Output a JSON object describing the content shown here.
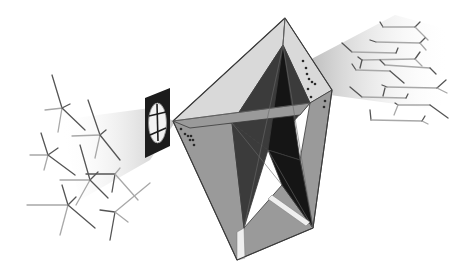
{
  "canvas": {
    "width": 470,
    "height": 271,
    "background": "#ffffff"
  },
  "colors": {
    "edge": "#3a3a3a",
    "face_light": "#d9d9d9",
    "face_mid": "#9a9a9a",
    "face_dark": "#3b3b3b",
    "face_black": "#151515",
    "molecule_dark": "#555555",
    "molecule_light": "#a8a8a8",
    "beam": "#bdbdbd",
    "filter_frame": "#1c1c1c",
    "filter_glass": "#f2f2f2",
    "dots": "#2a2a2a"
  },
  "crystal": {
    "vertices": {
      "apex": [
        285,
        18
      ],
      "left": [
        173,
        121
      ],
      "right": [
        332,
        90
      ],
      "bottom": [
        237,
        260
      ],
      "bottom_right": [
        313,
        228
      ],
      "inner_left": [
        232,
        123
      ],
      "inner_right": [
        310,
        103
      ],
      "inner_top": [
        283,
        45
      ],
      "inner_bottom": [
        244,
        228
      ],
      "star_mid": [
        268,
        150
      ],
      "star_lower": [
        282,
        185
      ]
    },
    "faces": [
      {
        "name": "top-left-face",
        "points": "285,18 173,121 232,123 283,45",
        "fill": "face_light"
      },
      {
        "name": "top-right-face",
        "points": "285,18 332,90 310,103 283,45",
        "fill": "face_light"
      },
      {
        "name": "left-face",
        "points": "173,121 232,123 244,228 237,260",
        "fill": "face_mid"
      },
      {
        "name": "right-face",
        "points": "332,90 313,228 300,160 310,103",
        "fill": "face_mid"
      },
      {
        "name": "bottom-face",
        "points": "237,260 313,228 282,185 244,228",
        "fill": "face_mid"
      },
      {
        "name": "inner-dark-upper",
        "points": "283,45 232,123 268,150 310,103",
        "fill": "face_dark"
      },
      {
        "name": "inner-black-core",
        "points": "283,45 268,150 300,160",
        "fill": "face_black"
      },
      {
        "name": "inner-dark-lower",
        "points": "232,123 244,228 268,150",
        "fill": "face_dark"
      },
      {
        "name": "inner-black-lower",
        "points": "268,150 300,160 313,228 282,185",
        "fill": "face_black"
      },
      {
        "name": "star-band",
        "points": "173,121 310,103 300,115 190,128",
        "fill": "face_mid"
      }
    ],
    "highlights": [
      {
        "name": "lower-light-sliver",
        "points": "272,195 310,222 306,226 268,199"
      },
      {
        "name": "bottom-left-sliver",
        "points": "237,232 244,228 245,258 237,260"
      }
    ],
    "dots_right": [
      [
        303,
        61
      ],
      [
        306,
        68
      ],
      [
        307,
        74
      ],
      [
        309,
        79
      ],
      [
        312,
        82
      ],
      [
        315,
        84
      ],
      [
        308,
        89
      ],
      [
        311,
        97
      ],
      [
        325,
        101
      ],
      [
        324,
        107
      ]
    ],
    "dots_left": [
      [
        185,
        134
      ],
      [
        188,
        136
      ],
      [
        191,
        136
      ],
      [
        193,
        140
      ],
      [
        190,
        140
      ],
      [
        194,
        145
      ],
      [
        181,
        129
      ]
    ]
  },
  "filter": {
    "frame": "145,98 170,88 170,146 145,158",
    "glass_center": [
      157.5,
      123
    ],
    "glass_rx": 9,
    "glass_ry": 20,
    "spokes": [
      [
        157,
        104,
        158,
        141
      ],
      [
        149,
        116,
        166,
        112
      ],
      [
        150,
        135,
        166,
        128
      ]
    ]
  },
  "beams": {
    "left": "60,120 150,108 175,122 150,160 80,200",
    "right": "300,65 395,15 450,30 440,110 330,95"
  },
  "molecules_left": [
    {
      "lines": [
        [
          52,
          75,
          62,
          108
        ],
        [
          45,
          110,
          63,
          108
        ],
        [
          62,
          108,
          70,
          104
        ],
        [
          62,
          108,
          58,
          132
        ],
        [
          62,
          108,
          85,
          130
        ]
      ]
    },
    {
      "lines": [
        [
          88,
          100,
          100,
          135
        ],
        [
          72,
          136,
          100,
          135
        ],
        [
          100,
          135,
          106,
          130
        ],
        [
          100,
          135,
          95,
          158
        ],
        [
          100,
          135,
          120,
          160
        ]
      ]
    },
    {
      "lines": [
        [
          41,
          133,
          48,
          155
        ],
        [
          30,
          155,
          48,
          155
        ],
        [
          48,
          155,
          58,
          148
        ],
        [
          48,
          155,
          44,
          170
        ],
        [
          48,
          155,
          75,
          175
        ]
      ]
    },
    {
      "lines": [
        [
          80,
          145,
          90,
          180
        ],
        [
          60,
          180,
          90,
          180
        ],
        [
          90,
          180,
          98,
          172
        ],
        [
          90,
          180,
          76,
          205
        ],
        [
          90,
          180,
          108,
          198
        ]
      ]
    },
    {
      "lines": [
        [
          86,
          174,
          115,
          174
        ],
        [
          115,
          174,
          120,
          168
        ],
        [
          115,
          174,
          112,
          192
        ],
        [
          115,
          174,
          138,
          200
        ]
      ]
    },
    {
      "lines": [
        [
          62,
          185,
          68,
          205
        ],
        [
          27,
          205,
          68,
          205
        ],
        [
          68,
          205,
          76,
          197
        ],
        [
          68,
          205,
          60,
          235
        ],
        [
          68,
          205,
          95,
          228
        ]
      ]
    },
    {
      "lines": [
        [
          100,
          210,
          115,
          212
        ],
        [
          115,
          212,
          150,
          183
        ],
        [
          115,
          212,
          110,
          240
        ],
        [
          115,
          212,
          128,
          222
        ]
      ]
    }
  ],
  "molecules_right": [
    {
      "lines": [
        [
          380,
          22,
          383,
          27
        ],
        [
          383,
          27,
          415,
          27
        ],
        [
          415,
          27,
          420,
          22
        ],
        [
          415,
          27,
          428,
          40
        ]
      ]
    },
    {
      "lines": [
        [
          370,
          40,
          376,
          42
        ],
        [
          376,
          42,
          420,
          43
        ],
        [
          420,
          43,
          425,
          38
        ],
        [
          420,
          43,
          426,
          50
        ]
      ]
    },
    {
      "lines": [
        [
          342,
          43,
          352,
          52
        ],
        [
          352,
          52,
          396,
          53
        ],
        [
          396,
          53,
          398,
          48
        ]
      ]
    },
    {
      "lines": [
        [
          358,
          57,
          362,
          60
        ],
        [
          362,
          60,
          415,
          59
        ],
        [
          415,
          59,
          420,
          52
        ],
        [
          415,
          59,
          422,
          66
        ],
        [
          362,
          60,
          360,
          68
        ]
      ]
    },
    {
      "lines": [
        [
          380,
          60,
          385,
          65
        ],
        [
          385,
          65,
          430,
          68
        ],
        [
          430,
          68,
          436,
          74
        ]
      ]
    },
    {
      "lines": [
        [
          352,
          64,
          356,
          70
        ],
        [
          356,
          70,
          390,
          71
        ],
        [
          390,
          71,
          404,
          83
        ]
      ]
    },
    {
      "lines": [
        [
          382,
          85,
          387,
          87
        ],
        [
          387,
          87,
          437,
          88
        ],
        [
          437,
          88,
          446,
          80
        ],
        [
          437,
          88,
          447,
          93
        ],
        [
          385,
          88,
          383,
          96
        ]
      ]
    },
    {
      "lines": [
        [
          350,
          87,
          362,
          97
        ],
        [
          362,
          97,
          406,
          98
        ],
        [
          406,
          98,
          408,
          94
        ]
      ]
    },
    {
      "lines": [
        [
          395,
          103,
          398,
          105
        ],
        [
          398,
          105,
          430,
          105
        ],
        [
          430,
          105,
          448,
          118
        ],
        [
          398,
          105,
          394,
          115
        ]
      ]
    },
    {
      "lines": [
        [
          370,
          110,
          371,
          120
        ],
        [
          371,
          120,
          422,
          121
        ],
        [
          422,
          121,
          425,
          116
        ],
        [
          422,
          121,
          428,
          124
        ]
      ]
    }
  ]
}
